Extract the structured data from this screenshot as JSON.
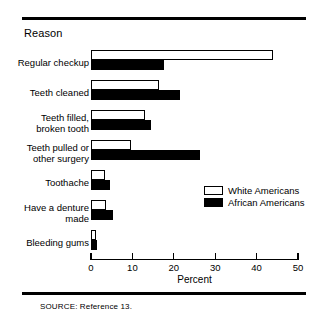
{
  "figure": {
    "axis_group_title": "Reason",
    "source_note": "SOURCE:  Reference 13."
  },
  "legend": {
    "position": "inside-right",
    "entries": [
      {
        "label": "White Americans",
        "swatch": "white"
      },
      {
        "label": "African Americans",
        "swatch": "black"
      }
    ]
  },
  "axis": {
    "title": "Percent",
    "ticks": [
      "0",
      "10",
      "20",
      "30",
      "40",
      "50"
    ]
  },
  "chart_data": {
    "type": "bar",
    "orientation": "horizontal",
    "title": "",
    "subtitle": "",
    "xlabel": "Percent",
    "ylabel": "Reason",
    "xlim": [
      0,
      50
    ],
    "xticks": [
      0,
      10,
      20,
      30,
      40,
      50
    ],
    "grid": false,
    "legend_position": "inside-right",
    "categories": [
      "Regular checkup",
      "Teeth cleaned",
      "Teeth filled,\nbroken tooth",
      "Teeth pulled or\nother surgery",
      "Toothache",
      "Have a denture\nmade",
      "Bleeding gums"
    ],
    "series": [
      {
        "name": "White Americans",
        "color": "#ffffff",
        "values": [
          44.0,
          16.5,
          13.0,
          9.7,
          3.4,
          3.6,
          1.3
        ]
      },
      {
        "name": "African Americans",
        "color": "#000000",
        "values": [
          17.6,
          21.5,
          14.5,
          26.3,
          4.6,
          5.3,
          1.5
        ]
      }
    ]
  }
}
